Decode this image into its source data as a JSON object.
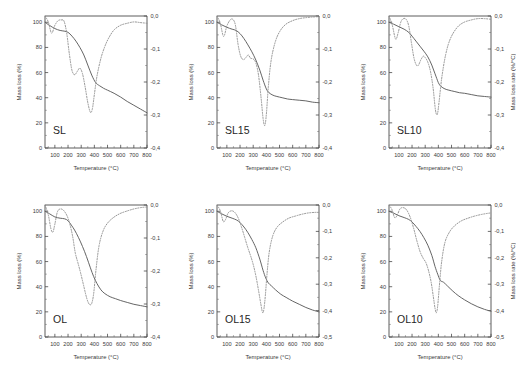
{
  "figure": {
    "panel_count": 6,
    "columns": 3,
    "rows": 2
  },
  "axes": {
    "xlabel": "Temperature (°C)",
    "ylabel_left": "Mass loss (%)",
    "ylabel_right": "Mass loss rate (%/°C)",
    "x_ticks": [
      "100",
      "200",
      "300",
      "400",
      "500",
      "600",
      "700",
      "800"
    ],
    "x_tick_values": [
      100,
      200,
      300,
      400,
      500,
      600,
      700,
      800
    ],
    "xlim": [
      25,
      800
    ],
    "y_left_ticks": [
      "0",
      "20",
      "40",
      "60",
      "80",
      "100"
    ],
    "y_left_tick_values": [
      0,
      20,
      40,
      60,
      80,
      100
    ],
    "ylim_left": [
      0,
      105
    ],
    "y_right_ticks_4": [
      "0,0",
      "-0,1",
      "-0,2",
      "-0,3",
      "-0,4"
    ],
    "y_right_tick_values_4": [
      0.0,
      -0.1,
      -0.2,
      -0.3,
      -0.4
    ],
    "y_right_ticks_5": [
      "0,0",
      "-0,1",
      "-0,2",
      "-0,3",
      "-0,4",
      "-0,5"
    ],
    "y_right_tick_values_5": [
      0.0,
      -0.1,
      -0.2,
      -0.3,
      -0.4,
      -0.5
    ]
  },
  "chart_data": [
    {
      "id": "sl",
      "type": "line",
      "title": "SL",
      "xlabel": "Temperature (°C)",
      "ylabel": "Mass loss (%)",
      "ylabel_right": "Mass loss rate (%/°C)",
      "xlim": [
        25,
        800
      ],
      "ylim": [
        0,
        105
      ],
      "ylim_right": [
        -0.4,
        0.0
      ],
      "grid": false,
      "legend": "none",
      "series": [
        {
          "name": "TG (mass loss)",
          "axis": "left",
          "style": "solid",
          "x": [
            25,
            60,
            100,
            140,
            170,
            200,
            230,
            260,
            290,
            320,
            350,
            380,
            410,
            440,
            470,
            500,
            550,
            600,
            650,
            700,
            750,
            800
          ],
          "values": [
            100,
            97.5,
            95,
            93.5,
            93,
            92,
            89,
            85,
            80,
            74,
            66,
            58,
            52,
            49.5,
            47.5,
            46,
            43.5,
            40.5,
            37,
            34,
            31,
            28
          ]
        },
        {
          "name": "DTG (mass loss rate)",
          "axis": "right",
          "style": "dotted",
          "x": [
            25,
            50,
            75,
            100,
            125,
            150,
            170,
            190,
            210,
            230,
            250,
            270,
            290,
            310,
            330,
            350,
            370,
            385,
            400,
            420,
            450,
            480,
            510,
            550,
            600,
            650,
            700,
            750,
            800
          ],
          "values": [
            0.0,
            -0.018,
            -0.052,
            -0.028,
            -0.014,
            -0.012,
            -0.016,
            -0.052,
            -0.115,
            -0.165,
            -0.178,
            -0.168,
            -0.158,
            -0.175,
            -0.215,
            -0.262,
            -0.292,
            -0.281,
            -0.238,
            -0.182,
            -0.128,
            -0.092,
            -0.066,
            -0.042,
            -0.028,
            -0.022,
            -0.018,
            -0.02,
            -0.022
          ]
        }
      ]
    },
    {
      "id": "sl15",
      "type": "line",
      "title": "SL15",
      "xlabel": "Temperature (°C)",
      "ylabel": "Mass loss (%)",
      "ylabel_right": "Mass loss rate (%/°C)",
      "xlim": [
        25,
        800
      ],
      "ylim": [
        0,
        105
      ],
      "ylim_right": [
        -0.4,
        0.0
      ],
      "grid": false,
      "legend": "none",
      "series": [
        {
          "name": "TG (mass loss)",
          "axis": "left",
          "style": "solid",
          "x": [
            25,
            60,
            100,
            140,
            170,
            200,
            230,
            260,
            290,
            320,
            350,
            375,
            400,
            420,
            450,
            480,
            520,
            560,
            600,
            650,
            700,
            750,
            800
          ],
          "values": [
            100,
            98,
            96,
            94.5,
            93.5,
            91,
            87,
            82,
            76.5,
            70,
            62,
            54,
            47,
            44,
            42,
            41,
            40,
            39,
            38.5,
            38,
            37.5,
            36.5,
            36
          ]
        },
        {
          "name": "DTG (mass loss rate)",
          "axis": "right",
          "style": "dotted",
          "x": [
            25,
            50,
            75,
            100,
            125,
            145,
            165,
            185,
            205,
            225,
            245,
            262,
            280,
            300,
            320,
            340,
            360,
            375,
            388,
            400,
            415,
            435,
            465,
            500,
            545,
            600,
            650,
            700,
            750,
            800
          ],
          "values": [
            0.0,
            -0.022,
            -0.062,
            -0.03,
            -0.012,
            -0.01,
            -0.028,
            -0.086,
            -0.122,
            -0.132,
            -0.126,
            -0.118,
            -0.128,
            -0.13,
            -0.142,
            -0.178,
            -0.248,
            -0.31,
            -0.332,
            -0.298,
            -0.215,
            -0.138,
            -0.082,
            -0.048,
            -0.026,
            -0.014,
            -0.008,
            -0.005,
            -0.003,
            -0.002
          ]
        }
      ]
    },
    {
      "id": "sl10",
      "type": "line",
      "title": "SL10",
      "xlabel": "Temperature (°C)",
      "ylabel": "Mass loss (%)",
      "ylabel_right": "Mass loss rate (%/°C)",
      "xlim": [
        25,
        800
      ],
      "ylim": [
        0,
        105
      ],
      "ylim_right": [
        -0.4,
        0.0
      ],
      "grid": false,
      "legend": "none",
      "series": [
        {
          "name": "TG (mass loss)",
          "axis": "left",
          "style": "solid",
          "x": [
            25,
            60,
            100,
            140,
            175,
            200,
            230,
            260,
            290,
            320,
            350,
            375,
            400,
            420,
            450,
            480,
            520,
            560,
            600,
            650,
            700,
            750,
            800
          ],
          "values": [
            100,
            98.5,
            96.5,
            94.5,
            92,
            89,
            85,
            81,
            77,
            72.5,
            66,
            59,
            52,
            49,
            47,
            46,
            45,
            44,
            43.5,
            42.5,
            41.5,
            41,
            40.5
          ]
        },
        {
          "name": "DTG (mass loss rate)",
          "axis": "right",
          "style": "dotted",
          "x": [
            25,
            50,
            75,
            95,
            115,
            135,
            155,
            175,
            195,
            215,
            235,
            250,
            268,
            285,
            300,
            320,
            340,
            360,
            378,
            392,
            405,
            425,
            455,
            490,
            540,
            590,
            650,
            700,
            750,
            800
          ],
          "values": [
            0.0,
            -0.028,
            -0.07,
            -0.05,
            -0.018,
            -0.008,
            -0.01,
            -0.03,
            -0.08,
            -0.128,
            -0.15,
            -0.148,
            -0.132,
            -0.122,
            -0.126,
            -0.14,
            -0.168,
            -0.218,
            -0.285,
            -0.298,
            -0.262,
            -0.19,
            -0.118,
            -0.07,
            -0.036,
            -0.02,
            -0.012,
            -0.008,
            -0.008,
            -0.01
          ]
        }
      ]
    },
    {
      "id": "ol",
      "type": "line",
      "title": "OL",
      "xlabel": "Temperature (°C)",
      "ylabel": "Mass loss (%)",
      "ylabel_right": "Mass loss rate (%/°C)",
      "xlim": [
        25,
        800
      ],
      "ylim": [
        0,
        105
      ],
      "ylim_right": [
        -0.4,
        0.0
      ],
      "grid": false,
      "legend": "none",
      "series": [
        {
          "name": "TG (mass loss)",
          "axis": "left",
          "style": "solid",
          "x": [
            25,
            60,
            100,
            140,
            175,
            200,
            225,
            250,
            280,
            310,
            340,
            370,
            395,
            420,
            450,
            480,
            520,
            560,
            600,
            650,
            700,
            750,
            800
          ],
          "values": [
            100,
            98,
            95.5,
            94.5,
            94,
            92.5,
            89,
            85,
            79,
            72,
            64,
            55,
            48,
            42.5,
            37.5,
            34.5,
            32,
            30.5,
            29,
            27.5,
            26,
            25,
            24
          ]
        },
        {
          "name": "DTG (mass loss rate)",
          "axis": "right",
          "style": "dotted",
          "x": [
            25,
            50,
            70,
            85,
            100,
            120,
            145,
            170,
            195,
            215,
            235,
            255,
            275,
            295,
            315,
            335,
            350,
            365,
            380,
            395,
            412,
            435,
            465,
            500,
            545,
            595,
            650,
            700,
            750,
            800
          ],
          "values": [
            0.0,
            -0.03,
            -0.072,
            -0.082,
            -0.058,
            -0.02,
            -0.012,
            -0.018,
            -0.035,
            -0.06,
            -0.095,
            -0.145,
            -0.175,
            -0.205,
            -0.238,
            -0.272,
            -0.292,
            -0.302,
            -0.298,
            -0.268,
            -0.198,
            -0.125,
            -0.08,
            -0.055,
            -0.038,
            -0.026,
            -0.018,
            -0.012,
            -0.008,
            -0.006
          ]
        }
      ]
    },
    {
      "id": "ol15",
      "type": "line",
      "title": "OL15",
      "xlabel": "Temperature (°C)",
      "ylabel": "Mass loss (%)",
      "ylabel_right": "Mass loss rate (%/°C)",
      "xlim": [
        25,
        800
      ],
      "ylim": [
        0,
        105
      ],
      "ylim_right": [
        -0.5,
        0.0
      ],
      "grid": false,
      "legend": "none",
      "series": [
        {
          "name": "TG (mass loss)",
          "axis": "left",
          "style": "solid",
          "x": [
            25,
            60,
            100,
            140,
            175,
            200,
            230,
            260,
            290,
            320,
            350,
            375,
            395,
            415,
            440,
            470,
            510,
            550,
            600,
            650,
            700,
            750,
            800
          ],
          "values": [
            100,
            98,
            96,
            94.5,
            93,
            91,
            87.5,
            83,
            77.5,
            71,
            62,
            53,
            47,
            43,
            40.5,
            37.5,
            34,
            31.5,
            28.5,
            26,
            23.5,
            21.5,
            20
          ]
        },
        {
          "name": "DTG (mass loss rate)",
          "axis": "right",
          "style": "dotted",
          "x": [
            25,
            50,
            72,
            90,
            110,
            135,
            160,
            185,
            210,
            235,
            258,
            280,
            300,
            320,
            340,
            358,
            372,
            382,
            392,
            405,
            422,
            448,
            480,
            520,
            570,
            620,
            670,
            720,
            770,
            800
          ],
          "values": [
            0.0,
            -0.022,
            -0.062,
            -0.055,
            -0.03,
            -0.022,
            -0.028,
            -0.048,
            -0.082,
            -0.122,
            -0.16,
            -0.192,
            -0.225,
            -0.268,
            -0.322,
            -0.375,
            -0.408,
            -0.392,
            -0.345,
            -0.262,
            -0.178,
            -0.118,
            -0.085,
            -0.066,
            -0.05,
            -0.042,
            -0.035,
            -0.03,
            -0.028,
            -0.028
          ]
        }
      ]
    },
    {
      "id": "ol10",
      "type": "line",
      "title": "OL10",
      "xlabel": "Temperature (°C)",
      "ylabel": "Mass loss (%)",
      "ylabel_right": "Mass loss rate (%/°C)",
      "xlim": [
        25,
        800
      ],
      "ylim": [
        0,
        105
      ],
      "ylim_right": [
        -0.5,
        0.0
      ],
      "grid": false,
      "legend": "none",
      "series": [
        {
          "name": "TG (mass loss)",
          "axis": "left",
          "style": "solid",
          "x": [
            25,
            60,
            100,
            140,
            175,
            200,
            230,
            260,
            290,
            320,
            350,
            375,
            395,
            415,
            440,
            470,
            510,
            550,
            600,
            650,
            700,
            750,
            800
          ],
          "values": [
            100,
            98.5,
            96.5,
            95,
            93.5,
            91.5,
            88,
            84,
            79,
            73,
            65,
            56,
            50,
            45,
            43.5,
            40.5,
            36.5,
            33,
            29.5,
            26.5,
            24,
            22,
            20.5
          ]
        },
        {
          "name": "DTG (mass loss rate)",
          "axis": "right",
          "style": "dotted",
          "x": [
            25,
            48,
            68,
            88,
            108,
            132,
            158,
            185,
            212,
            238,
            262,
            285,
            305,
            325,
            345,
            362,
            375,
            385,
            395,
            408,
            425,
            450,
            485,
            525,
            575,
            625,
            675,
            725,
            770,
            800
          ],
          "values": [
            0.0,
            -0.018,
            -0.048,
            -0.038,
            -0.015,
            -0.01,
            -0.018,
            -0.045,
            -0.088,
            -0.138,
            -0.178,
            -0.202,
            -0.218,
            -0.248,
            -0.292,
            -0.348,
            -0.392,
            -0.408,
            -0.382,
            -0.305,
            -0.215,
            -0.142,
            -0.102,
            -0.078,
            -0.06,
            -0.05,
            -0.042,
            -0.036,
            -0.032,
            -0.03
          ]
        }
      ]
    }
  ]
}
